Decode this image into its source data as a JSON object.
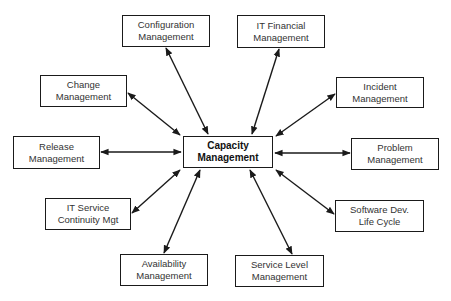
{
  "diagram": {
    "center": {
      "line1": "Capacity",
      "line2": "Management"
    },
    "nodes": [
      {
        "id": "configuration",
        "line1": "Configuration",
        "line2": "Management"
      },
      {
        "id": "it-financial",
        "line1": "IT Financial",
        "line2": "Management"
      },
      {
        "id": "change",
        "line1": "Change",
        "line2": "Management"
      },
      {
        "id": "incident",
        "line1": "Incident",
        "line2": "Management"
      },
      {
        "id": "release",
        "line1": "Release",
        "line2": "Management"
      },
      {
        "id": "problem",
        "line1": "Problem",
        "line2": "Management"
      },
      {
        "id": "it-service-continuity",
        "line1": "IT Service",
        "line2": "Continuity Mgt"
      },
      {
        "id": "software-dev",
        "line1": "Software Dev.",
        "line2": "Life Cycle"
      },
      {
        "id": "availability",
        "line1": "Availability",
        "line2": "Management"
      },
      {
        "id": "service-level",
        "line1": "Service Level",
        "line2": "Management"
      }
    ],
    "edges": [
      {
        "from": "configuration",
        "to": "center",
        "type": "bidirectional"
      },
      {
        "from": "it-financial",
        "to": "center",
        "type": "bidirectional"
      },
      {
        "from": "change",
        "to": "center",
        "type": "bidirectional"
      },
      {
        "from": "incident",
        "to": "center",
        "type": "bidirectional"
      },
      {
        "from": "release",
        "to": "center",
        "type": "bidirectional"
      },
      {
        "from": "problem",
        "to": "center",
        "type": "bidirectional"
      },
      {
        "from": "it-service-continuity",
        "to": "center",
        "type": "bidirectional"
      },
      {
        "from": "software-dev",
        "to": "center",
        "type": "bidirectional"
      },
      {
        "from": "availability",
        "to": "center",
        "type": "bidirectional"
      },
      {
        "from": "service-level",
        "to": "center",
        "type": "bidirectional"
      }
    ],
    "colors": {
      "line": "#1a1a1a",
      "text": "#333333",
      "background": "#ffffff"
    }
  }
}
